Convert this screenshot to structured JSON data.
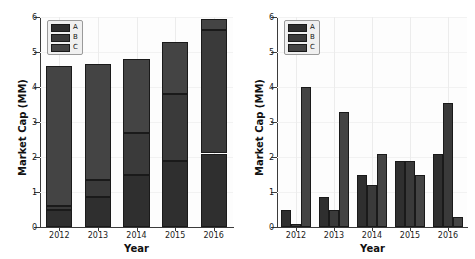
{
  "chart_data": [
    {
      "type": "bar",
      "subtype": "stacked",
      "panel": "left",
      "title": "",
      "xlabel": "Year",
      "ylabel": "Market Cap (MM)",
      "categories": [
        "2012",
        "2013",
        "2014",
        "2015",
        "2016"
      ],
      "ylim": [
        0,
        6
      ],
      "yticks": [
        0,
        1,
        2,
        3,
        4,
        5,
        6
      ],
      "ytick_labels": [
        "0",
        "1",
        "2",
        "3",
        "4",
        "5",
        "6"
      ],
      "grid": true,
      "legend_position": "upper left",
      "series": [
        {
          "name": "A",
          "values": [
            0.5,
            0.85,
            1.5,
            1.9,
            2.1
          ],
          "color": "#2f2f2f"
        },
        {
          "name": "B",
          "values": [
            0.1,
            0.5,
            1.2,
            1.9,
            3.53
          ],
          "color": "#3a3a3a"
        },
        {
          "name": "C",
          "values": [
            4.0,
            3.3,
            2.1,
            1.5,
            0.3
          ],
          "color": "#444444"
        }
      ],
      "totals": [
        4.6,
        4.65,
        4.8,
        5.3,
        5.93
      ]
    },
    {
      "type": "bar",
      "subtype": "grouped",
      "panel": "right",
      "title": "",
      "xlabel": "Year",
      "ylabel": "Market Cap (MM)",
      "categories": [
        "2012",
        "2013",
        "2014",
        "2015",
        "2016"
      ],
      "ylim": [
        0,
        6
      ],
      "yticks": [
        0,
        1,
        2,
        3,
        4,
        5,
        6
      ],
      "ytick_labels": [
        "0",
        "1",
        "2",
        "3",
        "4",
        "5",
        "6"
      ],
      "grid": true,
      "legend_position": "upper left",
      "series": [
        {
          "name": "A",
          "values": [
            0.5,
            0.85,
            1.5,
            1.9,
            2.1
          ],
          "color": "#2f2f2f"
        },
        {
          "name": "B",
          "values": [
            0.1,
            0.5,
            1.2,
            1.9,
            3.53
          ],
          "color": "#3a3a3a"
        },
        {
          "name": "C",
          "values": [
            4.0,
            3.3,
            2.1,
            1.5,
            0.3
          ],
          "color": "#444444"
        }
      ]
    }
  ],
  "left": {
    "ylabel": "Market Cap (MM)",
    "xlabel": "Year",
    "ytick_labels": [
      "6",
      "5",
      "4",
      "3",
      "2",
      "1",
      "0"
    ],
    "xtick_labels": [
      "2012",
      "2013",
      "2014",
      "2015",
      "2016"
    ],
    "legend": [
      "A",
      "B",
      "C"
    ]
  },
  "right": {
    "ylabel": "Market Cap (MM)",
    "xlabel": "Year",
    "ytick_labels": [
      "6",
      "5",
      "4",
      "3",
      "2",
      "1",
      "0"
    ],
    "xtick_labels": [
      "2012",
      "2013",
      "2014",
      "2015",
      "2016"
    ],
    "legend": [
      "A",
      "B",
      "C"
    ]
  }
}
